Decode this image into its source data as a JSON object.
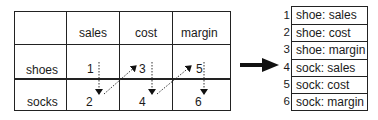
{
  "table": {
    "column_headers": [
      "sales",
      "cost",
      "margin"
    ],
    "row_headers": [
      "shoes",
      "socks"
    ],
    "cells": [
      [
        "1",
        "3",
        "5"
      ],
      [
        "2",
        "4",
        "6"
      ]
    ]
  },
  "traversal_arrows": [
    {
      "from": "1",
      "to": "2",
      "style": "dotted"
    },
    {
      "from": "2",
      "to": "3",
      "style": "dotted"
    },
    {
      "from": "3",
      "to": "4",
      "style": "dotted"
    },
    {
      "from": "4",
      "to": "5",
      "style": "dotted"
    },
    {
      "from": "5",
      "to": "6",
      "style": "dotted"
    }
  ],
  "transform_arrow": {
    "direction": "right"
  },
  "flat_list": {
    "indices": [
      "1",
      "2",
      "3",
      "4",
      "5",
      "6"
    ],
    "items": [
      "shoe: sales",
      "shoe: cost",
      "shoe: margin",
      "sock: sales",
      "sock: cost",
      "sock: margin"
    ]
  },
  "colors": {
    "line": "#222222",
    "background": "#ffffff"
  }
}
